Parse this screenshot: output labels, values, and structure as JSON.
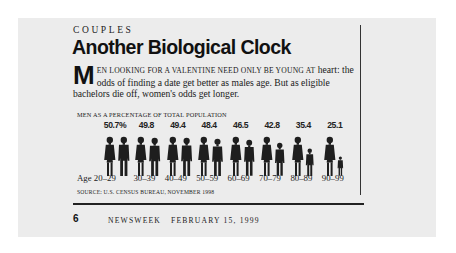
{
  "article": {
    "kicker": "COUPLES",
    "headline": "Another Biological Clock",
    "dek_dropcap": "M",
    "dek_caps": "EN LOOKING FOR A VALENTINE NEED ONLY BE YOUNG AT",
    "dek_rest": "heart: the odds of finding a date get better as males age. But as eligible bachelors die off, women's odds get longer."
  },
  "chart": {
    "title": "MEN AS A PERCENTAGE OF TOTAL POPULATION",
    "source": "SOURCE: U.S. CENSUS BUREAU, NOVEMBER 1998",
    "age_prefix": "Age",
    "colors": {
      "figure": "#1e1e1e",
      "background": "#ececec"
    }
  },
  "chart_data": {
    "type": "bar",
    "title": "Men as a percentage of total population",
    "xlabel": "Age",
    "ylabel": "Men (% of population)",
    "categories": [
      "20-29",
      "30-39",
      "40-49",
      "50-59",
      "60-69",
      "70-79",
      "80-89",
      "90-99"
    ],
    "labels": [
      "50.7%",
      "49.8",
      "49.4",
      "48.4",
      "46.5",
      "42.8",
      "35.4",
      "25.1"
    ],
    "values": [
      50.7,
      49.8,
      49.4,
      48.4,
      46.5,
      42.8,
      35.4,
      25.1
    ],
    "series": [
      {
        "name": "Men",
        "values": [
          50.7,
          49.8,
          49.4,
          48.4,
          46.5,
          42.8,
          35.4,
          25.1
        ]
      }
    ],
    "annotations": [
      "Pictograph: woman figure (left) and man figure (right); man figure shrinks with age"
    ],
    "source": "U.S. Census Bureau, November 1998"
  },
  "footer": {
    "page_number": "6",
    "publication": "NEWSWEEK",
    "date": "FEBRUARY 15, 1999"
  }
}
